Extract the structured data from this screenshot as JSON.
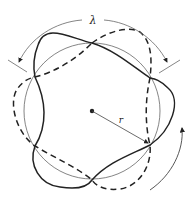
{
  "diagram": {
    "labels": {
      "wavelength": "λ",
      "radius": "r"
    },
    "geometry": {
      "center": [
        92,
        111
      ],
      "radius": 68,
      "node_count": 6
    },
    "colors": {
      "stroke": "#222222",
      "thin_stroke": "#555555",
      "background": "#ffffff"
    },
    "legend": {
      "solid": "wave shape (one phase)",
      "dashed": "wave shape (opposite phase)",
      "thin_circle": "reference circle of radius r"
    }
  }
}
